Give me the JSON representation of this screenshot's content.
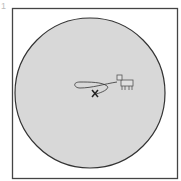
{
  "figure": {
    "label": "1",
    "colors": {
      "frame": "#444444",
      "circle_fill": "#d8d8d8",
      "circle_stroke": "#333333",
      "rope": "#333333",
      "post_marker": "#222222"
    },
    "elements": [
      "square-frame",
      "circle-field",
      "post-x-marker",
      "rope",
      "goat"
    ]
  }
}
